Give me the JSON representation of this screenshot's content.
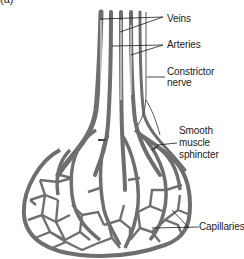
{
  "figure": {
    "label": "(a)"
  },
  "labels": {
    "veins": "Veins",
    "arteries": "Arteries",
    "constrictor_nerve_line1": "Constrictor",
    "constrictor_nerve_line2": "nerve",
    "sphincter_line1": "Smooth",
    "sphincter_line2": "muscle",
    "sphincter_line3": "sphincter",
    "capillaries": "Capillaries"
  },
  "colors": {
    "vessel": "#6e6e6e",
    "vessel_light": "#9a9a9a",
    "leader_line": "#1a1a1a",
    "background": "#ffffff"
  }
}
